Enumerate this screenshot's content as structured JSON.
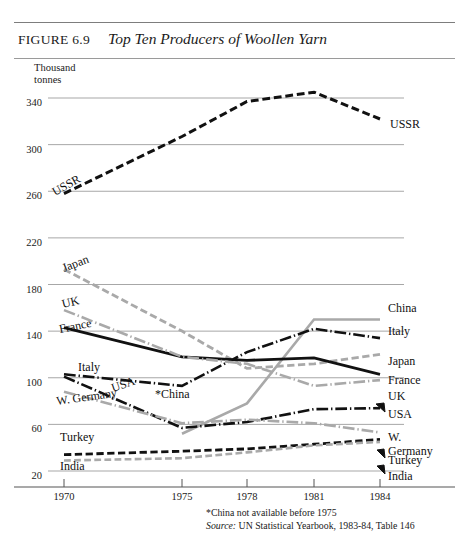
{
  "figure": {
    "number_label": "FIGURE 6.9",
    "title": "Top Ten Producers of Woollen Yarn",
    "y_axis_title_line1": "Thousand",
    "y_axis_title_line2": "tonnes",
    "footnote": "*China not available before 1975",
    "source_prefix": "Source:",
    "source_text": "UN Statistical Yearbook, 1983-84, Table 146"
  },
  "chart_data": {
    "type": "line",
    "title": "Top Ten Producers of Woollen Yarn",
    "xlabel": "",
    "ylabel": "Thousand tonnes",
    "x": [
      1970,
      1975,
      1978,
      1981,
      1984
    ],
    "xtick_labels": [
      "1970",
      "1975",
      "1978",
      "1981",
      "1984"
    ],
    "ytick_labels": [
      "340",
      "300",
      "260",
      "220",
      "180",
      "140",
      "100",
      "60",
      "20"
    ],
    "yticks": [
      340,
      300,
      260,
      220,
      180,
      140,
      100,
      60,
      20
    ],
    "ylim": [
      10,
      360
    ],
    "grid": true,
    "legend": "inline-endpoint-labels",
    "note": "Upper band shows USSR only; lower band shows the other nine producers.",
    "series": [
      {
        "name": "USSR",
        "label_left": "USSR",
        "label_right": "USSR",
        "style": "dashed",
        "color": "#111111",
        "width": 3.0,
        "values": [
          258,
          307,
          337,
          345,
          322
        ]
      },
      {
        "name": "China",
        "label_left": "*China",
        "label_right": "China",
        "style": "solid",
        "color": "#a9a9a9",
        "width": 2.6,
        "values": [
          null,
          52,
          78,
          150,
          150
        ]
      },
      {
        "name": "Italy",
        "label_left": "Italy",
        "label_right": "Italy",
        "style": "dashdot",
        "color": "#111111",
        "width": 2.6,
        "values": [
          103,
          93,
          122,
          142,
          134
        ]
      },
      {
        "name": "Japan",
        "label_left": "Japan",
        "label_right": "Japan",
        "style": "dashed",
        "color": "#a9a9a9",
        "width": 2.8,
        "values": [
          193,
          140,
          108,
          112,
          120
        ]
      },
      {
        "name": "France",
        "label_left": "France",
        "label_right": "France",
        "style": "solid",
        "color": "#111111",
        "width": 2.8,
        "values": [
          143,
          118,
          115,
          117,
          103
        ]
      },
      {
        "name": "UK",
        "label_left": "UK",
        "label_right": "UK",
        "style": "dashdot",
        "color": "#a9a9a9",
        "width": 2.6,
        "values": [
          158,
          118,
          112,
          93,
          98
        ]
      },
      {
        "name": "USA",
        "label_left": "USA",
        "label_right": "USA",
        "style": "dashdot",
        "color": "#111111",
        "width": 2.6,
        "values": [
          101,
          57,
          62,
          73,
          74
        ]
      },
      {
        "name": "W. Germany",
        "label_left": "W. Germany",
        "label_right_line1": "W.",
        "label_right_line2": "Germany",
        "style": "dashdot",
        "color": "#a9a9a9",
        "width": 2.6,
        "values": [
          88,
          61,
          64,
          61,
          53
        ]
      },
      {
        "name": "Turkey",
        "label_left": "Turkey",
        "label_right": "Turkey",
        "style": "dashed",
        "color": "#111111",
        "width": 2.8,
        "values": [
          34,
          37,
          39,
          43,
          47
        ]
      },
      {
        "name": "India",
        "label_left": "India",
        "label_right": "India",
        "style": "dashed",
        "color": "#a9a9a9",
        "width": 2.6,
        "values": [
          29,
          31,
          36,
          42,
          45
        ]
      }
    ]
  }
}
